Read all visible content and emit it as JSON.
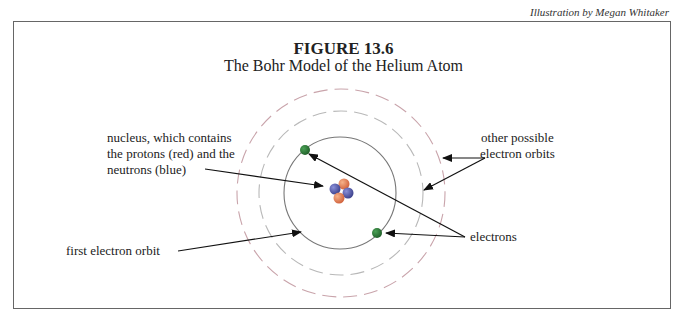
{
  "credit": "Illustration by Megan Whitaker",
  "figure": {
    "number": "FIGURE 13.6",
    "title": "The Bohr Model of the Helium Atom"
  },
  "labels": {
    "nucleus_line1": "nucleus, which contains",
    "nucleus_line2": "the protons (red) and the",
    "nucleus_line3": "neutrons (blue)",
    "other_orbits_line1": "other possible",
    "other_orbits_line2": "electron orbits",
    "first_orbit": "first electron orbit",
    "electrons": "electrons"
  },
  "colors": {
    "proton": "#e07a4a",
    "neutron": "#4a4fa0",
    "electron": "#2e7a3a",
    "orbit": "#777777",
    "dashed_orbit": "#c8a8ae",
    "frame": "#666666"
  }
}
